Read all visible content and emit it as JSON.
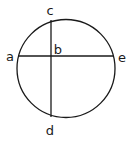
{
  "diagram": {
    "type": "circle-with-chords",
    "stroke_color": "#1a1a1a",
    "background": "#ffffff",
    "circle": {
      "cx": 66,
      "cy": 68.5,
      "r": 49
    },
    "chords": [
      {
        "name": "ae",
        "from": "a",
        "to": "e",
        "x1": 18,
        "y1": 56,
        "x2": 113,
        "y2": 56
      },
      {
        "name": "cd",
        "from": "c",
        "to": "d",
        "x1": 51,
        "y1": 20,
        "x2": 51,
        "y2": 117
      }
    ],
    "labels": {
      "a": "a",
      "b": "b",
      "c": "c",
      "d": "d",
      "e": "e"
    },
    "intersection_point": "b"
  }
}
